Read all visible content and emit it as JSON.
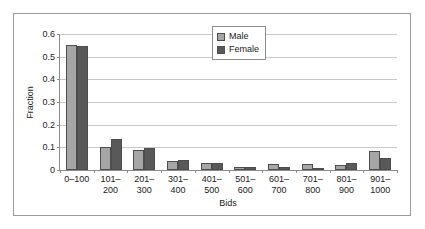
{
  "chart_data": {
    "type": "bar",
    "title": "",
    "xlabel": "Bids",
    "ylabel": "Fraction",
    "ylim": [
      0,
      0.6
    ],
    "ytick_labels": [
      "0",
      "0.1",
      "0.2",
      "0.3",
      "0.4",
      "0.5",
      "0.6"
    ],
    "ytick_values": [
      0,
      0.1,
      0.2,
      0.3,
      0.4,
      0.5,
      0.6
    ],
    "grid": true,
    "legend_position": "top-right",
    "categories": [
      "0–100",
      "101–\n200",
      "201–\n300",
      "301–\n400",
      "401–\n500",
      "501–\n600",
      "601–\n700",
      "701–\n800",
      "801–\n900",
      "901–\n1000"
    ],
    "category_labels": [
      [
        "0–100",
        ""
      ],
      [
        "101–",
        "200"
      ],
      [
        "201–",
        "300"
      ],
      [
        "301–",
        "400"
      ],
      [
        "401–",
        "500"
      ],
      [
        "501–",
        "600"
      ],
      [
        "601–",
        "700"
      ],
      [
        "701–",
        "800"
      ],
      [
        "801–",
        "900"
      ],
      [
        "901–",
        "1000"
      ]
    ],
    "series": [
      {
        "name": "Male",
        "color": "#a6a6a6",
        "values": [
          0.551,
          0.103,
          0.089,
          0.039,
          0.033,
          0.012,
          0.026,
          0.028,
          0.021,
          0.086
        ]
      },
      {
        "name": "Female",
        "color": "#595959",
        "values": [
          0.546,
          0.139,
          0.095,
          0.045,
          0.03,
          0.014,
          0.015,
          0.011,
          0.03,
          0.055
        ]
      }
    ]
  },
  "legend": {
    "items": [
      {
        "label": "Male"
      },
      {
        "label": "Female"
      }
    ]
  }
}
